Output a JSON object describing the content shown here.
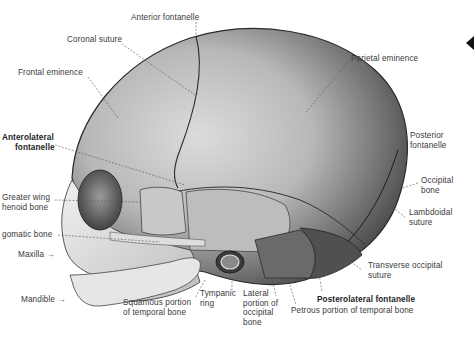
{
  "figure": {
    "labels": [
      {
        "id": "anterior-fontanelle",
        "text": "Anterior fontanelle",
        "bold": false
      },
      {
        "id": "coronal-suture",
        "text": "Coronal suture",
        "bold": false
      },
      {
        "id": "frontal-eminence",
        "text": "Frontal eminence",
        "bold": false
      },
      {
        "id": "parietal-eminence",
        "text": "Parietal eminence",
        "bold": false
      },
      {
        "id": "anterolateral-fontanelle",
        "text": "Anterolateral fontanelle",
        "line1": "Anterolateral",
        "line2": "fontanelle",
        "bold": true
      },
      {
        "id": "greater-wing-sphenoid",
        "text": "Greater wing of sphenoid bone",
        "line1": "Greater wing",
        "line2": "henoid bone",
        "bold": false
      },
      {
        "id": "zygomatic-bone",
        "text": "gomatic bone",
        "bold": false
      },
      {
        "id": "maxilla",
        "text": "Maxilla →",
        "bold": false
      },
      {
        "id": "mandible",
        "text": "Mandible →",
        "bold": false
      },
      {
        "id": "squamous-temporal",
        "text": "Squamous portion of temporal bone",
        "line1": "Squamous portion",
        "line2": "of temporal bone",
        "bold": false
      },
      {
        "id": "tympanic-ring",
        "text": "Tympanic ring",
        "line1": "Tympanic",
        "line2": "ring",
        "bold": false
      },
      {
        "id": "lateral-occipital",
        "text": "Lateral portion of occipital bone",
        "line1": "Lateral",
        "line2": "portion of",
        "line3": "occipital",
        "line4": "bone",
        "bold": false
      },
      {
        "id": "posterolateral-fontanelle",
        "text": "Posterolateral fontanelle",
        "bold": true
      },
      {
        "id": "petrous-temporal",
        "text": "Petrous portion of temporal bone",
        "bold": false
      },
      {
        "id": "posterior-fontanelle",
        "text": "Posterior fontanelle",
        "line1": "Posterior",
        "line2": "fontanelle",
        "bold": false
      },
      {
        "id": "occipital-bone",
        "text": "Occipital bone",
        "line1": "Occipital",
        "line2": "bone",
        "bold": false
      },
      {
        "id": "lambdoidal-suture",
        "text": "Lambdoidal suture",
        "line1": "Lambdoidal",
        "line2": "suture",
        "bold": false
      },
      {
        "id": "transverse-occipital-suture",
        "text": "Transverse occipital suture",
        "line1": "Transverse occipital",
        "line2": "suture",
        "bold": false
      }
    ],
    "colors": {
      "background": "#ffffff",
      "bone_light": "#d9d9d9",
      "bone_mid": "#9a9a9a",
      "bone_dark": "#3c3c3c",
      "label_text": "#3a3a3a",
      "leader_line": "#555555"
    }
  }
}
